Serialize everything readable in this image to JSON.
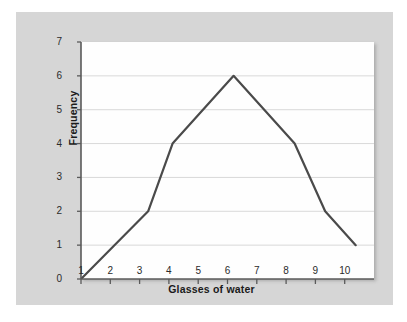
{
  "chart_data": {
    "type": "line",
    "title": "",
    "subtitle": "",
    "xlabel": "Glasses of water",
    "ylabel": "Frequency",
    "xlim": [
      1,
      10.6
    ],
    "ylim": [
      0,
      7
    ],
    "xticks": [
      "1",
      "2",
      "3",
      "4",
      "5",
      "6",
      "7",
      "8",
      "9",
      "10"
    ],
    "yticks": [
      "0",
      "1",
      "2",
      "3",
      "4",
      "5",
      "6",
      "7"
    ],
    "grid": "horizontal",
    "legend": "none",
    "series": [
      {
        "name": "Frequency polygon",
        "color": "#4a4a4a",
        "x": [
          1,
          3.2,
          4,
          6,
          8,
          9,
          10
        ],
        "values": [
          0,
          2,
          4,
          6,
          4,
          2,
          1
        ]
      }
    ],
    "annotations": []
  },
  "figure": {
    "panel_color": "#d6d6d6",
    "plot_background": "#fefefe",
    "gridline_color": "#d9d9d9",
    "axis_color": "#5a5a5a",
    "line_color": "#4a4a4a",
    "text_color": "#1b1b1b"
  }
}
